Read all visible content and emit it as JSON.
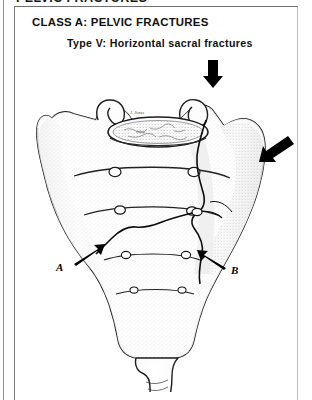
{
  "page": {
    "running_header": "PELVIC FRACTURES",
    "background_color": "#ffffff",
    "ink_color": "#111111"
  },
  "heading": {
    "title": "CLASS A: PELVIC FRACTURES",
    "subtitle": "Type V: Horizontal sacral fractures"
  },
  "figure": {
    "name": "sacrum-anterior-view-illustration",
    "artist_signature": "J. Jones",
    "labels": [
      {
        "id": "A",
        "text": "A",
        "x": 46,
        "y": 214,
        "arrow_from": [
          58,
          211
        ],
        "arrow_to": [
          86,
          196
        ]
      },
      {
        "id": "B",
        "text": "B",
        "x": 219,
        "y": 218,
        "arrow_from": [
          212,
          215
        ],
        "arrow_to": [
          188,
          202
        ]
      }
    ],
    "force_arrows": [
      {
        "name": "downward-force-arrow",
        "direction": "down",
        "x": 198,
        "y": 18
      },
      {
        "name": "oblique-force-arrow",
        "direction": "down-left",
        "x": 248,
        "y": 96
      }
    ],
    "foramina_rows": 4,
    "foramina_per_row": 2,
    "fracture_lines": 2
  }
}
